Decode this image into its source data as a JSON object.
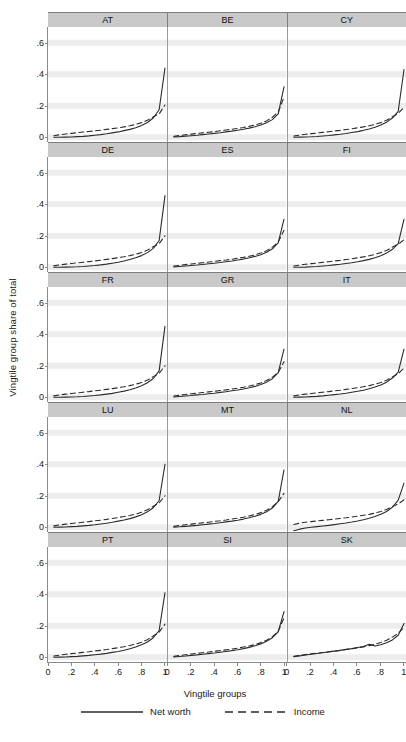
{
  "chart_data": {
    "type": "line",
    "title": "",
    "xlabel": "Vingtile groups",
    "ylabel": "Vingtile group share of total",
    "xlim": [
      0,
      1.02
    ],
    "ylim": [
      -0.03,
      0.7
    ],
    "xticks": [
      "0",
      ".2",
      ".4",
      ".6",
      ".8",
      "1"
    ],
    "xtick_values": [
      0,
      0.2,
      0.4,
      0.6,
      0.8,
      1
    ],
    "yticks": [
      "0",
      ".2",
      ".4",
      ".6"
    ],
    "ytick_values": [
      0,
      0.2,
      0.4,
      0.6
    ],
    "grid": true,
    "legend_position": "bottom",
    "legend": [
      {
        "name": "Net worth",
        "style": "solid",
        "color": "#2b2b2b"
      },
      {
        "name": "Income",
        "style": "dashed",
        "color": "#2b2b2b"
      }
    ],
    "x": [
      0.05,
      0.1,
      0.15,
      0.2,
      0.25,
      0.3,
      0.35,
      0.4,
      0.45,
      0.5,
      0.55,
      0.6,
      0.65,
      0.7,
      0.75,
      0.8,
      0.85,
      0.9,
      0.95,
      1.0
    ],
    "panels": [
      {
        "label": "AT",
        "series": [
          {
            "name": "Net worth",
            "values": [
              0.0,
              0.0,
              0.001,
              0.002,
              0.004,
              0.006,
              0.009,
              0.013,
              0.017,
              0.022,
              0.028,
              0.034,
              0.042,
              0.05,
              0.061,
              0.075,
              0.094,
              0.122,
              0.175,
              0.44
            ]
          },
          {
            "name": "Income",
            "values": [
              0.01,
              0.016,
              0.021,
              0.025,
              0.029,
              0.033,
              0.037,
              0.041,
              0.045,
              0.05,
              0.055,
              0.06,
              0.066,
              0.073,
              0.082,
              0.093,
              0.108,
              0.13,
              0.148,
              0.205
            ]
          }
        ]
      },
      {
        "label": "BE",
        "series": [
          {
            "name": "Net worth",
            "values": [
              0.002,
              0.004,
              0.007,
              0.01,
              0.013,
              0.017,
              0.021,
              0.025,
              0.029,
              0.034,
              0.039,
              0.045,
              0.051,
              0.058,
              0.067,
              0.078,
              0.092,
              0.112,
              0.148,
              0.32
            ]
          },
          {
            "name": "Income",
            "values": [
              0.006,
              0.011,
              0.016,
              0.02,
              0.024,
              0.028,
              0.032,
              0.036,
              0.041,
              0.046,
              0.051,
              0.056,
              0.062,
              0.069,
              0.078,
              0.089,
              0.104,
              0.127,
              0.16,
              0.255
            ]
          }
        ]
      },
      {
        "label": "CY",
        "series": [
          {
            "name": "Net worth",
            "values": [
              0.0,
              0.001,
              0.002,
              0.003,
              0.005,
              0.008,
              0.011,
              0.015,
              0.019,
              0.024,
              0.03,
              0.036,
              0.044,
              0.053,
              0.064,
              0.078,
              0.096,
              0.122,
              0.165,
              0.43
            ]
          },
          {
            "name": "Income",
            "values": [
              0.008,
              0.014,
              0.019,
              0.023,
              0.027,
              0.031,
              0.035,
              0.04,
              0.044,
              0.049,
              0.054,
              0.06,
              0.066,
              0.073,
              0.082,
              0.093,
              0.108,
              0.13,
              0.152,
              0.19
            ]
          }
        ]
      },
      {
        "label": "DE",
        "series": [
          {
            "name": "Net worth",
            "values": [
              0.0,
              0.0,
              0.001,
              0.002,
              0.003,
              0.005,
              0.008,
              0.011,
              0.015,
              0.02,
              0.026,
              0.032,
              0.04,
              0.049,
              0.06,
              0.074,
              0.093,
              0.12,
              0.17,
              0.455
            ]
          },
          {
            "name": "Income",
            "values": [
              0.009,
              0.015,
              0.02,
              0.024,
              0.028,
              0.032,
              0.036,
              0.04,
              0.045,
              0.05,
              0.055,
              0.061,
              0.067,
              0.074,
              0.083,
              0.094,
              0.109,
              0.131,
              0.15,
              0.2
            ]
          }
        ]
      },
      {
        "label": "ES",
        "series": [
          {
            "name": "Net worth",
            "values": [
              0.002,
              0.005,
              0.008,
              0.011,
              0.014,
              0.018,
              0.022,
              0.026,
              0.03,
              0.035,
              0.04,
              0.046,
              0.052,
              0.06,
              0.069,
              0.08,
              0.095,
              0.117,
              0.155,
              0.305
            ]
          },
          {
            "name": "Income",
            "values": [
              0.007,
              0.012,
              0.017,
              0.021,
              0.025,
              0.029,
              0.033,
              0.037,
              0.042,
              0.046,
              0.051,
              0.057,
              0.063,
              0.07,
              0.079,
              0.09,
              0.105,
              0.128,
              0.16,
              0.235
            ]
          }
        ]
      },
      {
        "label": "FI",
        "series": [
          {
            "name": "Net worth",
            "values": [
              0.0,
              0.0,
              0.001,
              0.003,
              0.005,
              0.008,
              0.011,
              0.015,
              0.019,
              0.024,
              0.029,
              0.035,
              0.042,
              0.05,
              0.06,
              0.073,
              0.09,
              0.114,
              0.15,
              0.305
            ]
          },
          {
            "name": "Income",
            "values": [
              0.008,
              0.014,
              0.019,
              0.023,
              0.027,
              0.031,
              0.035,
              0.04,
              0.044,
              0.049,
              0.054,
              0.06,
              0.066,
              0.073,
              0.082,
              0.093,
              0.107,
              0.128,
              0.146,
              0.175
            ]
          }
        ]
      },
      {
        "label": "FR",
        "series": [
          {
            "name": "Net worth",
            "values": [
              0.0,
              0.0,
              0.001,
              0.002,
              0.003,
              0.005,
              0.008,
              0.011,
              0.015,
              0.02,
              0.025,
              0.032,
              0.039,
              0.048,
              0.059,
              0.073,
              0.092,
              0.119,
              0.168,
              0.45
            ]
          },
          {
            "name": "Income",
            "values": [
              0.009,
              0.015,
              0.02,
              0.024,
              0.028,
              0.032,
              0.036,
              0.041,
              0.045,
              0.05,
              0.055,
              0.061,
              0.067,
              0.074,
              0.083,
              0.094,
              0.109,
              0.131,
              0.152,
              0.2
            ]
          }
        ]
      },
      {
        "label": "GR",
        "series": [
          {
            "name": "Net worth",
            "values": [
              0.002,
              0.005,
              0.008,
              0.011,
              0.015,
              0.018,
              0.022,
              0.026,
              0.031,
              0.035,
              0.041,
              0.046,
              0.053,
              0.06,
              0.069,
              0.081,
              0.096,
              0.118,
              0.157,
              0.305
            ]
          },
          {
            "name": "Income",
            "values": [
              0.008,
              0.013,
              0.018,
              0.022,
              0.026,
              0.03,
              0.034,
              0.038,
              0.043,
              0.047,
              0.052,
              0.058,
              0.064,
              0.071,
              0.08,
              0.091,
              0.106,
              0.128,
              0.158,
              0.225
            ]
          }
        ]
      },
      {
        "label": "IT",
        "series": [
          {
            "name": "Net worth",
            "values": [
              0.0,
              0.001,
              0.002,
              0.004,
              0.006,
              0.009,
              0.013,
              0.017,
              0.021,
              0.026,
              0.032,
              0.038,
              0.045,
              0.054,
              0.065,
              0.078,
              0.096,
              0.122,
              0.16,
              0.305
            ]
          },
          {
            "name": "Income",
            "values": [
              0.009,
              0.015,
              0.02,
              0.024,
              0.028,
              0.032,
              0.036,
              0.041,
              0.045,
              0.05,
              0.055,
              0.061,
              0.067,
              0.074,
              0.083,
              0.094,
              0.108,
              0.129,
              0.15,
              0.185
            ]
          }
        ]
      },
      {
        "label": "LU",
        "series": [
          {
            "name": "Net worth",
            "values": [
              0.0,
              0.001,
              0.002,
              0.004,
              0.006,
              0.009,
              0.012,
              0.016,
              0.021,
              0.026,
              0.032,
              0.039,
              0.046,
              0.055,
              0.066,
              0.08,
              0.098,
              0.124,
              0.17,
              0.4
            ]
          },
          {
            "name": "Income",
            "values": [
              0.009,
              0.015,
              0.02,
              0.024,
              0.028,
              0.032,
              0.036,
              0.041,
              0.045,
              0.05,
              0.056,
              0.062,
              0.068,
              0.075,
              0.084,
              0.096,
              0.111,
              0.133,
              0.155,
              0.2
            ]
          }
        ]
      },
      {
        "label": "MT",
        "series": [
          {
            "name": "Net worth",
            "values": [
              0.001,
              0.003,
              0.006,
              0.009,
              0.012,
              0.016,
              0.02,
              0.024,
              0.029,
              0.034,
              0.039,
              0.045,
              0.052,
              0.06,
              0.07,
              0.082,
              0.098,
              0.122,
              0.165,
              0.365
            ]
          },
          {
            "name": "Income",
            "values": [
              0.006,
              0.011,
              0.016,
              0.02,
              0.024,
              0.028,
              0.032,
              0.037,
              0.041,
              0.046,
              0.052,
              0.058,
              0.064,
              0.072,
              0.081,
              0.093,
              0.108,
              0.131,
              0.162,
              0.215
            ]
          }
        ]
      },
      {
        "label": "NL",
        "series": [
          {
            "name": "Net worth",
            "values": [
              -0.022,
              -0.012,
              -0.005,
              0.0,
              0.004,
              0.008,
              0.012,
              0.017,
              0.022,
              0.027,
              0.033,
              0.04,
              0.048,
              0.057,
              0.068,
              0.082,
              0.1,
              0.127,
              0.172,
              0.28
            ]
          },
          {
            "name": "Income",
            "values": [
              0.018,
              0.026,
              0.032,
              0.036,
              0.04,
              0.044,
              0.048,
              0.052,
              0.056,
              0.06,
              0.065,
              0.07,
              0.076,
              0.082,
              0.09,
              0.1,
              0.113,
              0.131,
              0.148,
              0.175
            ]
          }
        ]
      },
      {
        "label": "PT",
        "series": [
          {
            "name": "Net worth",
            "values": [
              0.0,
              0.001,
              0.002,
              0.004,
              0.006,
              0.009,
              0.012,
              0.016,
              0.02,
              0.025,
              0.031,
              0.037,
              0.045,
              0.054,
              0.065,
              0.079,
              0.097,
              0.124,
              0.17,
              0.41
            ]
          },
          {
            "name": "Income",
            "values": [
              0.008,
              0.014,
              0.019,
              0.023,
              0.027,
              0.031,
              0.035,
              0.04,
              0.044,
              0.049,
              0.055,
              0.061,
              0.067,
              0.075,
              0.084,
              0.096,
              0.112,
              0.135,
              0.16,
              0.21
            ]
          }
        ]
      },
      {
        "label": "SI",
        "series": [
          {
            "name": "Net worth",
            "values": [
              0.002,
              0.005,
              0.008,
              0.012,
              0.015,
              0.019,
              0.023,
              0.027,
              0.032,
              0.037,
              0.042,
              0.048,
              0.055,
              0.063,
              0.073,
              0.085,
              0.101,
              0.124,
              0.162,
              0.29
            ]
          },
          {
            "name": "Income",
            "values": [
              0.006,
              0.011,
              0.016,
              0.021,
              0.025,
              0.029,
              0.033,
              0.038,
              0.042,
              0.047,
              0.052,
              0.058,
              0.065,
              0.072,
              0.081,
              0.093,
              0.108,
              0.131,
              0.165,
              0.25
            ]
          }
        ]
      },
      {
        "label": "SK",
        "series": [
          {
            "name": "Net worth",
            "values": [
              0.004,
              0.009,
              0.014,
              0.019,
              0.024,
              0.029,
              0.034,
              0.039,
              0.044,
              0.05,
              0.055,
              0.062,
              0.068,
              0.082,
              0.072,
              0.08,
              0.092,
              0.11,
              0.14,
              0.215
            ]
          },
          {
            "name": "Income",
            "values": [
              0.006,
              0.012,
              0.017,
              0.022,
              0.026,
              0.03,
              0.035,
              0.039,
              0.044,
              0.049,
              0.054,
              0.06,
              0.066,
              0.074,
              0.083,
              0.094,
              0.108,
              0.128,
              0.152,
              0.19
            ]
          }
        ]
      }
    ]
  },
  "layout": {
    "rows": 5,
    "cols": 3,
    "header_bg": "#c9c9c9",
    "grid_color": "#ededed",
    "axis_color": "#8a8a8a",
    "line_color": "#2b2b2b"
  }
}
